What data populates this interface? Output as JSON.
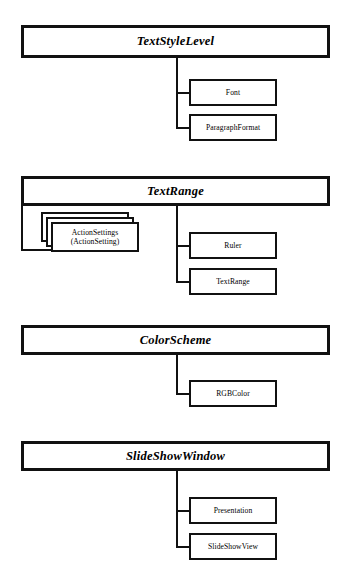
{
  "diagram": {
    "style": {
      "background": "#ffffff",
      "line_color": "#111111",
      "box_fill": "#ffffff",
      "text_color": "#000000"
    },
    "groups": [
      {
        "id": "textstylelevel",
        "parent": {
          "label": "TextStyleLevel"
        },
        "children": [
          {
            "label": "Font",
            "kind": "object"
          },
          {
            "label": "ParagraphFormat",
            "kind": "object"
          }
        ]
      },
      {
        "id": "textrange",
        "parent": {
          "label": "TextRange"
        },
        "children": [
          {
            "label": "ActionSettings\n(ActionSetting)",
            "kind": "collection",
            "stacked": 3
          },
          {
            "label": "Ruler",
            "kind": "object"
          },
          {
            "label": "TextRange",
            "kind": "object"
          }
        ]
      },
      {
        "id": "colorscheme",
        "parent": {
          "label": "ColorScheme"
        },
        "children": [
          {
            "label": "RGBColor",
            "kind": "object"
          }
        ]
      },
      {
        "id": "slideshowwindow",
        "parent": {
          "label": "SlideShowWindow"
        },
        "children": [
          {
            "label": "Presentation",
            "kind": "object"
          },
          {
            "label": "SlideShowView",
            "kind": "object"
          }
        ]
      }
    ]
  }
}
